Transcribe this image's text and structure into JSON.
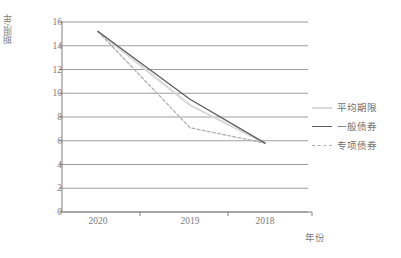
{
  "chart_data": {
    "type": "line",
    "title": "",
    "xlabel": "年份",
    "ylabel": "期限/年",
    "categories": [
      "2020",
      "2019",
      "2018"
    ],
    "x": [
      2020,
      2019,
      2018
    ],
    "ylim": [
      0,
      16
    ],
    "ytick_step": 2,
    "yticks": [
      "0",
      "2",
      "4",
      "6",
      "8",
      "10",
      "12",
      "14",
      "16"
    ],
    "grid": "horizontal",
    "legend_position": "right",
    "x_axis_direction": "descending-years",
    "series": [
      {
        "name": "平均期限",
        "style": "solid",
        "color": "#d9d9d9",
        "values": [
          15.2,
          9.0,
          5.8
        ]
      },
      {
        "name": "一般债券",
        "style": "solid",
        "color": "#5c5c5c",
        "values": [
          15.2,
          9.5,
          5.8
        ]
      },
      {
        "name": "专项债券",
        "style": "dashed",
        "color": "#b0b0b0",
        "values": [
          15.2,
          7.1,
          5.8
        ]
      }
    ]
  },
  "axis": {
    "ylabel": "期限/年",
    "xlabel": "年份",
    "yticks": [
      {
        "label": "16",
        "value": 16
      },
      {
        "label": "14",
        "value": 14
      },
      {
        "label": "12",
        "value": 12
      },
      {
        "label": "10",
        "value": 10
      },
      {
        "label": "8",
        "value": 8
      },
      {
        "label": "6",
        "value": 6
      },
      {
        "label": "4",
        "value": 4
      },
      {
        "label": "2",
        "value": 2
      },
      {
        "label": "0",
        "value": 0
      }
    ],
    "xticks": [
      {
        "label": "2020"
      },
      {
        "label": "2019"
      },
      {
        "label": "2018"
      }
    ]
  },
  "legend": {
    "items": [
      {
        "label": "平均期限",
        "swatch": "solid-light"
      },
      {
        "label": "一般债券",
        "swatch": "solid-dark"
      },
      {
        "label": "专项债券",
        "swatch": "dashed"
      }
    ]
  },
  "colors": {
    "axis": "#808080",
    "grid": "#8c8c8c",
    "series_average": "#d9d9d9",
    "series_general": "#5c5c5c",
    "series_special": "#b0b0b0",
    "text": "#7d7d7d"
  }
}
